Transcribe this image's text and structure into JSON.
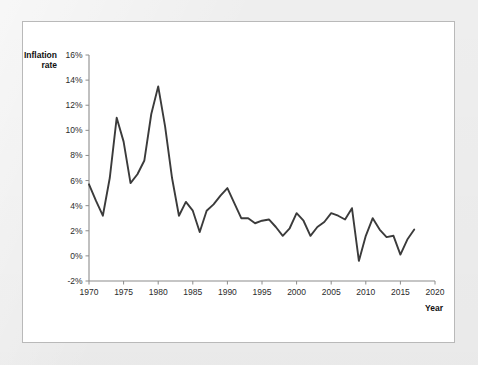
{
  "panel": {
    "background_color": "#ffffff",
    "border_color": "#b9b9b9",
    "outer_background_color": "#eeeeee"
  },
  "chart_data": {
    "type": "line",
    "title": "",
    "xlabel": "Year",
    "ylabel": "Inflation rate",
    "ylabel_line1": "Inflation",
    "ylabel_line2": "rate",
    "line_color": "#3b3b3b",
    "axis_color": "#8c8c8c",
    "grid": false,
    "legend": false,
    "legend_position": "none",
    "xlim": [
      1970,
      2020
    ],
    "ylim": [
      -2,
      16
    ],
    "xticks": [
      1970,
      1975,
      1980,
      1985,
      1990,
      1995,
      2000,
      2005,
      2010,
      2015,
      2020
    ],
    "xtick_labels": [
      "1970",
      "1975",
      "1980",
      "1985",
      "1990",
      "1995",
      "2000",
      "2005",
      "2010",
      "2015",
      "2020"
    ],
    "yticks": [
      -2,
      0,
      2,
      4,
      6,
      8,
      10,
      12,
      14,
      16
    ],
    "ytick_labels": [
      "-2%",
      "0%",
      "2%",
      "4%",
      "6%",
      "8%",
      "10%",
      "12%",
      "14%",
      "16%"
    ],
    "x": [
      1970,
      1971,
      1972,
      1973,
      1974,
      1975,
      1976,
      1977,
      1978,
      1979,
      1980,
      1981,
      1982,
      1983,
      1984,
      1985,
      1986,
      1987,
      1988,
      1989,
      1990,
      1991,
      1992,
      1993,
      1994,
      1995,
      1996,
      1997,
      1998,
      1999,
      2000,
      2001,
      2002,
      2003,
      2004,
      2005,
      2006,
      2007,
      2008,
      2009,
      2010,
      2011,
      2012,
      2013,
      2014,
      2015,
      2016,
      2017
    ],
    "values": [
      5.7,
      4.4,
      3.2,
      6.2,
      11.0,
      9.1,
      5.8,
      6.5,
      7.6,
      11.3,
      13.5,
      10.3,
      6.2,
      3.2,
      4.3,
      3.6,
      1.9,
      3.6,
      4.1,
      4.8,
      5.4,
      4.2,
      3.0,
      3.0,
      2.6,
      2.8,
      2.9,
      2.3,
      1.6,
      2.2,
      3.4,
      2.8,
      1.6,
      2.3,
      2.7,
      3.4,
      3.2,
      2.9,
      3.8,
      -0.4,
      1.6,
      3.0,
      2.1,
      1.5,
      1.6,
      0.1,
      1.3,
      2.1
    ],
    "series_name": "Inflation rate"
  }
}
